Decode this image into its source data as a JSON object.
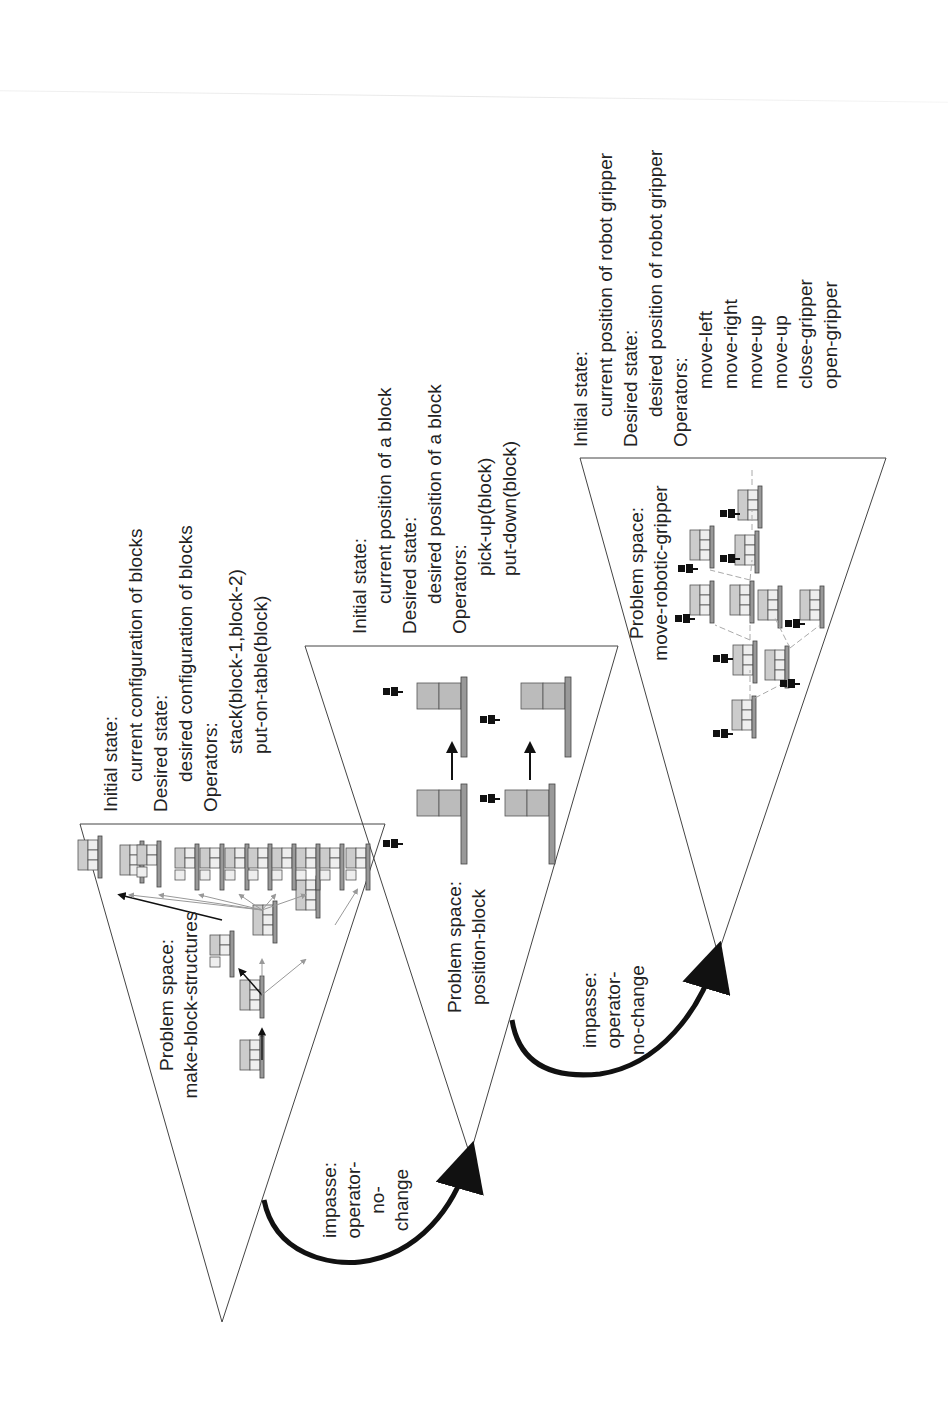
{
  "figure": {
    "colors": {
      "line": "#333333",
      "block_fill": "#bdbdbd",
      "block_edge": "#555555",
      "arc": "#111111",
      "gray_arrow": "#9a9a9a"
    }
  },
  "spaces": [
    {
      "id": "make-block-structures",
      "title_line1": "Problem space:",
      "title_line2": "make-block-structures",
      "info": {
        "initial_label": "Initial state:",
        "initial_value": "current configuration of blocks",
        "desired_label": "Desired state:",
        "desired_value": "desired configuration of blocks",
        "operators_label": "Operators:",
        "operators": [
          "stack(block-1,block-2)",
          "put-on-table(block)"
        ]
      },
      "block_labels": [
        "A",
        "B",
        "C"
      ]
    },
    {
      "id": "position-block",
      "title_line1": "Problem space:",
      "title_line2": "position-block",
      "info": {
        "initial_label": "Initial state:",
        "initial_value": "current position of a block",
        "desired_label": "Desired state:",
        "desired_value": "desired position of a block",
        "operators_label": "Operators:",
        "operators": [
          "pick-up(block)",
          "put-down(block)"
        ]
      },
      "block_labels": [
        "A",
        "B",
        "C"
      ]
    },
    {
      "id": "move-robotic-gripper",
      "title_line1": "Problem space:",
      "title_line2": "move-robotic-gripper",
      "info": {
        "initial_label": "Initial state:",
        "initial_value": "current position of robot gripper",
        "desired_label": "Desired state:",
        "desired_value": "desired position of robot gripper",
        "operators_label": "Operators:",
        "operators": [
          "move-left",
          "move-right",
          "move-up",
          "move-up",
          "close-gripper",
          "open-gripper"
        ]
      }
    }
  ],
  "impasses": [
    {
      "line1": "impasse:",
      "line2": "operator-",
      "line3": "no-",
      "line4": "change"
    },
    {
      "line1": "impasse:",
      "line2": "operator-",
      "line3": "no-change"
    }
  ]
}
